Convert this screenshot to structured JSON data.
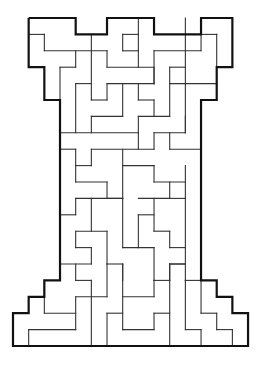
{
  "puzzle": {
    "type": "maze",
    "shape": "chess-rook",
    "grid": {
      "cols": 15,
      "rows": 20,
      "origin_x": 13,
      "origin_y": 18,
      "cell_w": 15.67,
      "cell_h": 16.4
    },
    "colors": {
      "wall": "#333333",
      "outer": "#111111",
      "background": "#ffffff"
    },
    "outline": [
      [
        1,
        0
      ],
      [
        4,
        0
      ],
      [
        4,
        1
      ],
      [
        6,
        1
      ],
      [
        6,
        0
      ],
      [
        9,
        0
      ],
      [
        9,
        1
      ],
      [
        12,
        1
      ],
      [
        12,
        0
      ],
      [
        14,
        0
      ],
      [
        14,
        3
      ],
      [
        13,
        3
      ],
      [
        13,
        5
      ],
      [
        12,
        5
      ],
      [
        12,
        16
      ],
      [
        13,
        16
      ],
      [
        13,
        17
      ],
      [
        14,
        17
      ],
      [
        14,
        18
      ],
      [
        15,
        18
      ],
      [
        15,
        20
      ],
      [
        0,
        20
      ],
      [
        0,
        18
      ],
      [
        1,
        18
      ],
      [
        1,
        17
      ],
      [
        2,
        17
      ],
      [
        2,
        16
      ],
      [
        3,
        16
      ],
      [
        3,
        5
      ],
      [
        2,
        5
      ],
      [
        2,
        3
      ],
      [
        1,
        3
      ],
      [
        1,
        0
      ]
    ],
    "walls": [
      [
        1,
        1,
        2,
        1
      ],
      [
        2,
        1,
        2,
        2
      ],
      [
        2,
        2,
        6,
        2
      ],
      [
        4,
        2,
        4,
        3
      ],
      [
        3,
        3,
        4,
        3
      ],
      [
        3,
        3,
        3,
        5
      ],
      [
        5,
        1,
        5,
        5
      ],
      [
        4,
        4,
        5,
        4
      ],
      [
        4,
        4,
        4,
        7
      ],
      [
        6,
        2,
        6,
        3
      ],
      [
        6,
        3,
        9,
        3
      ],
      [
        8,
        0,
        8,
        3
      ],
      [
        7,
        1,
        8,
        1
      ],
      [
        7,
        1,
        7,
        2
      ],
      [
        7,
        2,
        8,
        2
      ],
      [
        9,
        2,
        12,
        2
      ],
      [
        9,
        2,
        9,
        4
      ],
      [
        12,
        1,
        13,
        1
      ],
      [
        12,
        1,
        12,
        2
      ],
      [
        13,
        1,
        13,
        3
      ],
      [
        11,
        0,
        11,
        4
      ],
      [
        10,
        3,
        11,
        3
      ],
      [
        10,
        3,
        10,
        6
      ],
      [
        10,
        4,
        13,
        4
      ],
      [
        9,
        3,
        9,
        4
      ],
      [
        5,
        5,
        6,
        5
      ],
      [
        6,
        4,
        9,
        4
      ],
      [
        6,
        4,
        6,
        5
      ],
      [
        7,
        4,
        7,
        6
      ],
      [
        5,
        6,
        7,
        6
      ],
      [
        5,
        6,
        5,
        7
      ],
      [
        8,
        4,
        8,
        5
      ],
      [
        8,
        5,
        9,
        5
      ],
      [
        9,
        5,
        9,
        6
      ],
      [
        8,
        6,
        10,
        6
      ],
      [
        8,
        6,
        8,
        7
      ],
      [
        11,
        4,
        11,
        7
      ],
      [
        3,
        7,
        8,
        7
      ],
      [
        9,
        7,
        11,
        7
      ],
      [
        11,
        6,
        11,
        7
      ],
      [
        3,
        8,
        4,
        8
      ],
      [
        5,
        8,
        9,
        8
      ],
      [
        4,
        8,
        4,
        10
      ],
      [
        5,
        8,
        5,
        9
      ],
      [
        4,
        9,
        5,
        9
      ],
      [
        4,
        10,
        6,
        10
      ],
      [
        6,
        10,
        6,
        11
      ],
      [
        6,
        11,
        7,
        11
      ],
      [
        7,
        8,
        7,
        11
      ],
      [
        7,
        9,
        9,
        9
      ],
      [
        8,
        7,
        8,
        8
      ],
      [
        9,
        7,
        9,
        8
      ],
      [
        10,
        7,
        10,
        8
      ],
      [
        10,
        8,
        12,
        8
      ],
      [
        9,
        9,
        9,
        10
      ],
      [
        9,
        10,
        11,
        10
      ],
      [
        11,
        9,
        11,
        11
      ],
      [
        10,
        10,
        10,
        11
      ],
      [
        10,
        11,
        11,
        11
      ],
      [
        4,
        11,
        7,
        11
      ],
      [
        8,
        11,
        10,
        11
      ],
      [
        4,
        11,
        4,
        12
      ],
      [
        3,
        12,
        4,
        12
      ],
      [
        5,
        11,
        5,
        13
      ],
      [
        7,
        11,
        7,
        14
      ],
      [
        4,
        13,
        6,
        13
      ],
      [
        4,
        13,
        4,
        14
      ],
      [
        4,
        14,
        5,
        14
      ],
      [
        5,
        14,
        5,
        15
      ],
      [
        6,
        13,
        6,
        15
      ],
      [
        3,
        15,
        5,
        15
      ],
      [
        6,
        15,
        7,
        15
      ],
      [
        4,
        15,
        4,
        16
      ],
      [
        7,
        15,
        7,
        16
      ],
      [
        7,
        14,
        9,
        14
      ],
      [
        9,
        14,
        9,
        16
      ],
      [
        8,
        12,
        8,
        14
      ],
      [
        8,
        12,
        9,
        12
      ],
      [
        9,
        11,
        9,
        13
      ],
      [
        9,
        13,
        10,
        13
      ],
      [
        10,
        13,
        10,
        14
      ],
      [
        10,
        14,
        11,
        14
      ],
      [
        11,
        11,
        11,
        16
      ],
      [
        10,
        15,
        11,
        15
      ],
      [
        10,
        15,
        10,
        16
      ],
      [
        9,
        16,
        10,
        16
      ],
      [
        4,
        16,
        5,
        16
      ],
      [
        5,
        16,
        5,
        20
      ],
      [
        4,
        17,
        6,
        17
      ],
      [
        6,
        15,
        6,
        17
      ],
      [
        4,
        17,
        4,
        19
      ],
      [
        1,
        19,
        4,
        19
      ],
      [
        1,
        19,
        1,
        20
      ],
      [
        2,
        18,
        4,
        18
      ],
      [
        2,
        16,
        2,
        18
      ],
      [
        6,
        18,
        6,
        20
      ],
      [
        6,
        18,
        7,
        18
      ],
      [
        7,
        15,
        7,
        19
      ],
      [
        7,
        17,
        9,
        17
      ],
      [
        9,
        16,
        9,
        17
      ],
      [
        9,
        18,
        10,
        18
      ],
      [
        9,
        18,
        9,
        19
      ],
      [
        7,
        19,
        9,
        19
      ],
      [
        10,
        15,
        10,
        20
      ],
      [
        10,
        15,
        11,
        15
      ],
      [
        11,
        16,
        12,
        16
      ],
      [
        11,
        16,
        11,
        19
      ],
      [
        11,
        19,
        12,
        19
      ],
      [
        12,
        19,
        12,
        20
      ],
      [
        12,
        16,
        12,
        18
      ],
      [
        12,
        18,
        13,
        18
      ],
      [
        13,
        18,
        13,
        19
      ],
      [
        13,
        19,
        14,
        19
      ],
      [
        14,
        19,
        14,
        20
      ]
    ]
  }
}
